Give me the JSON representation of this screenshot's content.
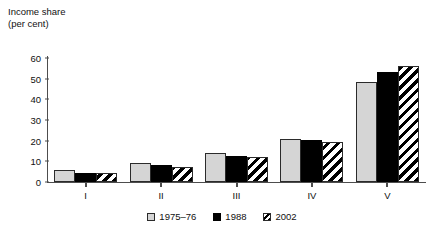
{
  "chart_data": {
    "type": "bar",
    "title": "",
    "ylabel": "Income share\n(per cent)",
    "ylabel_line1": "Income share",
    "ylabel_line2": "(per cent)",
    "xlabel": "",
    "categories": [
      "I",
      "II",
      "III",
      "IV",
      "V"
    ],
    "series": [
      {
        "name": "1975–76",
        "values": [
          6,
          9,
          14,
          21,
          48.5
        ],
        "color": "#d5d5d5",
        "pattern": "solid-light-gray"
      },
      {
        "name": "1988",
        "values": [
          4.5,
          8,
          12.5,
          20.5,
          53
        ],
        "color": "#000000",
        "pattern": "solid-black"
      },
      {
        "name": "2002",
        "values": [
          4.5,
          7.5,
          12,
          19.5,
          56
        ],
        "color": "#ffffff",
        "pattern": "diagonal-hatch"
      }
    ],
    "ylim": [
      0,
      60
    ],
    "yticks": [
      0,
      10,
      20,
      30,
      40,
      50,
      60
    ],
    "grid": false,
    "legend_position": "bottom-center"
  }
}
